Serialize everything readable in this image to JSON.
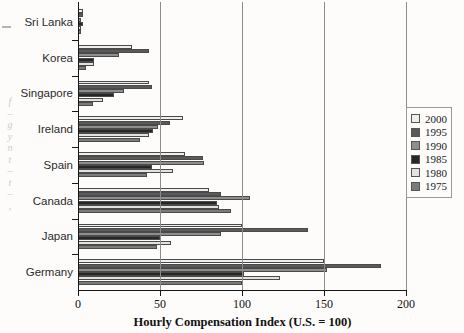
{
  "chart_data": {
    "type": "bar",
    "orientation": "horizontal",
    "title": "",
    "xlabel": "Hourly Compensation Index (U.S. = 100)",
    "ylabel": "",
    "xlim": [
      0,
      200
    ],
    "xticks": [
      0,
      50,
      100,
      150,
      200
    ],
    "xticklabels": [
      "0",
      "50",
      "100",
      "150",
      "200"
    ],
    "grid": "vertical",
    "legend_position": "right",
    "categories": [
      "Sri Lanka",
      "Korea",
      "Singapore",
      "Ireland",
      "Spain",
      "Canada",
      "Japan",
      "Germany"
    ],
    "series": [
      {
        "name": "2000",
        "color": "#f0efeb",
        "values": [
          3,
          33,
          43,
          64,
          65,
          80,
          100,
          150
        ]
      },
      {
        "name": "1995",
        "color": "#5a5a5a",
        "values": [
          3,
          43,
          45,
          56,
          76,
          87,
          140,
          185
        ]
      },
      {
        "name": "1990",
        "color": "#8e8e8e",
        "values": [
          2,
          25,
          28,
          49,
          77,
          105,
          87,
          152
        ]
      },
      {
        "name": "1985",
        "color": "#272727",
        "values": [
          3,
          10,
          22,
          46,
          45,
          85,
          50,
          101
        ]
      },
      {
        "name": "1980",
        "color": "#e3e2dd",
        "values": [
          2,
          10,
          15,
          43,
          58,
          86,
          57,
          123
        ]
      },
      {
        "name": "1975",
        "color": "#7b7b7b",
        "values": [
          2,
          5,
          9,
          38,
          42,
          93,
          48,
          100
        ]
      }
    ]
  },
  "legend": {
    "items": [
      {
        "label": "2000",
        "swatch": "#f0efeb"
      },
      {
        "label": "1995",
        "swatch": "#5a5a5a"
      },
      {
        "label": "1990",
        "swatch": "#8e8e8e"
      },
      {
        "label": "1985",
        "swatch": "#272727"
      },
      {
        "label": "1980",
        "swatch": "#e3e2dd"
      },
      {
        "label": "1975",
        "swatch": "#7b7b7b"
      }
    ]
  },
  "margin_bleed": {
    "lines": [
      "f",
      "–",
      "g",
      "y",
      "n",
      "t",
      "–",
      "t",
      "–",
      ","
    ]
  }
}
